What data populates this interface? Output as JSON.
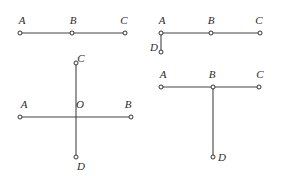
{
  "page": {
    "background_color": "#ffffff",
    "line_color": "#444444",
    "point_fill_color": "#ffffff",
    "point_stroke_color": "#333333",
    "label_color": "#2b2b2b",
    "width": 281,
    "height": 176
  },
  "figures": [
    {
      "id": "figure-1",
      "name": "collinear-points-abc",
      "labels": {
        "a": "A",
        "b": "B",
        "c": "C"
      },
      "label_positions": {
        "a": {
          "x": 22,
          "y": 26
        },
        "b": {
          "x": 73,
          "y": 26
        },
        "c": {
          "x": 124,
          "y": 26
        }
      },
      "points": {
        "a": {
          "x": 20,
          "y": 33
        },
        "b": {
          "x": 72,
          "y": 33
        },
        "c": {
          "x": 125,
          "y": 33
        }
      },
      "segments": [
        {
          "name": "segment-ac",
          "x1": 20,
          "y1": 33,
          "x2": 125,
          "y2": 33
        }
      ]
    },
    {
      "id": "figure-2",
      "name": "segment-abc-with-perpendicular-ad",
      "labels": {
        "a": "A",
        "b": "B",
        "c": "C",
        "d": "D"
      },
      "label_positions": {
        "a": {
          "x": 162,
          "y": 26
        },
        "b": {
          "x": 211,
          "y": 26
        },
        "c": {
          "x": 259,
          "y": 26
        },
        "d": {
          "x": 154,
          "y": 53
        }
      },
      "points": {
        "a": {
          "x": 161,
          "y": 33
        },
        "b": {
          "x": 211,
          "y": 33
        },
        "c": {
          "x": 260,
          "y": 33
        },
        "d": {
          "x": 161,
          "y": 52
        }
      },
      "segments": [
        {
          "name": "segment-ac",
          "x1": 161,
          "y1": 33,
          "x2": 260,
          "y2": 33
        },
        {
          "name": "segment-ad",
          "x1": 161,
          "y1": 33,
          "x2": 161,
          "y2": 52
        }
      ]
    },
    {
      "id": "figure-3",
      "name": "crossed-segments-ab-cd-at-o",
      "labels": {
        "a": "A",
        "b": "B",
        "c": "C",
        "d": "D",
        "o": "O"
      },
      "label_positions": {
        "a": {
          "x": 24,
          "y": 110
        },
        "b": {
          "x": 128,
          "y": 110
        },
        "c": {
          "x": 81,
          "y": 64
        },
        "d": {
          "x": 81,
          "y": 172
        },
        "o": {
          "x": 80,
          "y": 110
        }
      },
      "points": {
        "a": {
          "x": 20,
          "y": 117
        },
        "b": {
          "x": 131,
          "y": 117
        },
        "c": {
          "x": 76,
          "y": 63
        },
        "d": {
          "x": 76,
          "y": 157
        },
        "o": {
          "x": 76,
          "y": 117
        }
      },
      "segments": [
        {
          "name": "segment-ab",
          "x1": 20,
          "y1": 117,
          "x2": 131,
          "y2": 117
        },
        {
          "name": "segment-cd",
          "x1": 76,
          "y1": 63,
          "x2": 76,
          "y2": 157
        }
      ]
    },
    {
      "id": "figure-4",
      "name": "segment-abc-with-perpendicular-bd",
      "labels": {
        "a": "A",
        "b": "B",
        "c": "C",
        "d": "D"
      },
      "label_positions": {
        "a": {
          "x": 163,
          "y": 80
        },
        "b": {
          "x": 212,
          "y": 80
        },
        "c": {
          "x": 260,
          "y": 80
        },
        "d": {
          "x": 222,
          "y": 163
        }
      },
      "points": {
        "a": {
          "x": 161,
          "y": 87
        },
        "b": {
          "x": 213,
          "y": 87
        },
        "c": {
          "x": 259,
          "y": 87
        },
        "d": {
          "x": 213,
          "y": 157
        }
      },
      "segments": [
        {
          "name": "segment-ac",
          "x1": 161,
          "y1": 87,
          "x2": 259,
          "y2": 87
        },
        {
          "name": "segment-bd",
          "x1": 213,
          "y1": 87,
          "x2": 213,
          "y2": 157
        }
      ]
    }
  ]
}
